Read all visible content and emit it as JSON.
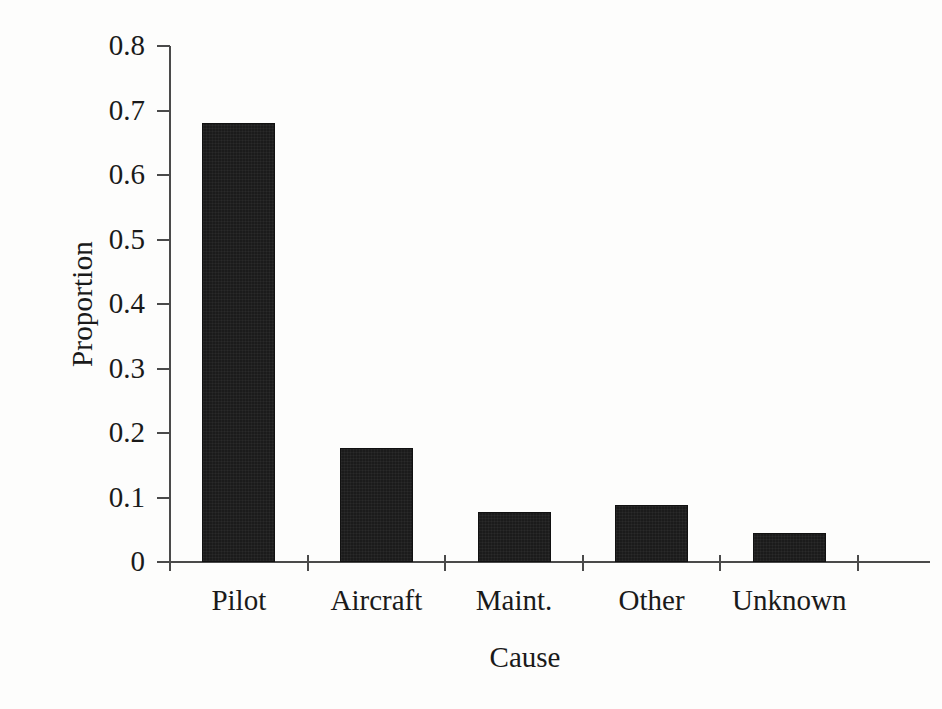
{
  "chart_data": {
    "type": "bar",
    "title": "",
    "subtitle": "",
    "xlabel": "Cause",
    "ylabel": "Proportion",
    "categories": [
      "Pilot",
      "Aircraft",
      "Maint.",
      "Other",
      "Unknown"
    ],
    "values": [
      0.68,
      0.177,
      0.078,
      0.088,
      0.045
    ],
    "ylim": [
      0,
      0.8
    ],
    "xlim": [
      0,
      5
    ],
    "yticks": [
      0,
      0.1,
      0.2,
      0.3,
      0.4,
      0.5,
      0.6,
      0.7,
      0.8
    ],
    "ytick_labels": [
      "0",
      "0.1",
      "0.2",
      "0.3",
      "0.4",
      "0.5",
      "0.6",
      "0.7",
      "0.8"
    ],
    "grid": false,
    "legend": null,
    "legend_position": "none",
    "series": [
      {
        "name": "Proportion",
        "color": "#1b1b1b",
        "values": [
          0.68,
          0.177,
          0.078,
          0.088,
          0.045
        ]
      }
    ],
    "annotations": []
  },
  "style": {
    "bar_color": "#1b1b1b",
    "axis_color": "#4a4a4a",
    "text_color": "#1a1a1a",
    "background": "#fdfdfc"
  }
}
